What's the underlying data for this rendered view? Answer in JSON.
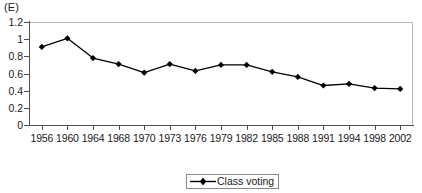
{
  "panel": {
    "label": "(E)"
  },
  "legend": {
    "position": "bottom-center",
    "entries": [
      {
        "label": "Class voting",
        "marker": "diamond",
        "color": "#000000"
      }
    ]
  },
  "axis": {
    "y_ticks": [
      "0",
      "0.2",
      "0.4",
      "0.6",
      "0.8",
      "1",
      "1.2"
    ],
    "x_ticks": [
      "1956",
      "1960",
      "1964",
      "1968",
      "1970",
      "1973",
      "1976",
      "1979",
      "1982",
      "1985",
      "1988",
      "1991",
      "1994",
      "1998",
      "2002"
    ]
  },
  "colors": {
    "series": "#000000",
    "axis": "#4f4f4f",
    "frame": "#b9b9b9",
    "text": "#1a1a1a",
    "background": "#ffffff"
  },
  "chart_data": {
    "type": "line",
    "title": "(E)",
    "xlabel": "",
    "ylabel": "",
    "categories": [
      "1956",
      "1960",
      "1964",
      "1968",
      "1970",
      "1973",
      "1976",
      "1979",
      "1982",
      "1985",
      "1988",
      "1991",
      "1994",
      "1998",
      "2002"
    ],
    "series": [
      {
        "name": "Class voting",
        "values": [
          0.91,
          1.01,
          0.78,
          0.71,
          0.61,
          0.71,
          0.63,
          0.7,
          0.7,
          0.62,
          0.56,
          0.46,
          0.48,
          0.43,
          0.42
        ],
        "marker": "diamond",
        "color": "#000000"
      }
    ],
    "ylim": [
      0,
      1.2
    ],
    "ytick_values": [
      0,
      0.2,
      0.4,
      0.6,
      0.8,
      1.0,
      1.2
    ],
    "grid": false,
    "legend": "bottom-center"
  }
}
